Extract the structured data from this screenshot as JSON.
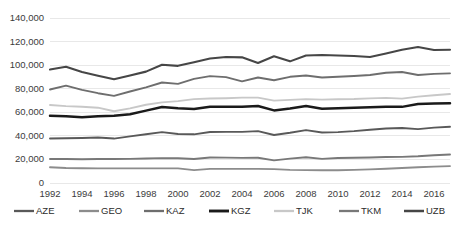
{
  "chart_data": {
    "type": "line",
    "title": "",
    "subtitle": "",
    "xlabel": "",
    "ylabel": "",
    "xlim": [
      1992,
      2017
    ],
    "ylim": [
      0,
      140000
    ],
    "ytick_values": [
      0,
      20000,
      40000,
      60000,
      80000,
      100000,
      120000,
      140000
    ],
    "ytick_labels": [
      "0",
      "20,000",
      "40,000",
      "60,000",
      "80,000",
      "100,000",
      "120,000",
      "140,000"
    ],
    "xtick_values": [
      1992,
      1994,
      1996,
      1998,
      2000,
      2002,
      2004,
      2006,
      2008,
      2010,
      2012,
      2014,
      2016
    ],
    "xtick_labels": [
      "1992",
      "1994",
      "1996",
      "1998",
      "2000",
      "2002",
      "2004",
      "2006",
      "2008",
      "2010",
      "2012",
      "2014",
      "2016"
    ],
    "x": [
      1992,
      1993,
      1994,
      1995,
      1996,
      1997,
      1998,
      1999,
      2000,
      2001,
      2002,
      2003,
      2004,
      2005,
      2006,
      2007,
      2008,
      2009,
      2010,
      2011,
      2012,
      2013,
      2014,
      2015,
      2016,
      2017
    ],
    "grid": "horizontal",
    "legend_position": "bottom",
    "series": [
      {
        "name": "AZE",
        "color": "#595959",
        "width": 1.9,
        "values": [
          37800,
          38000,
          38200,
          38600,
          37700,
          39600,
          41400,
          43200,
          41600,
          41300,
          43300,
          43400,
          43400,
          44000,
          40700,
          42600,
          44900,
          42800,
          43200,
          44000,
          45200,
          46200,
          46700,
          45700,
          47000,
          47700
        ]
      },
      {
        "name": "GEO",
        "color": "#8c8c8c",
        "width": 1.9,
        "values": [
          13400,
          12700,
          12500,
          12400,
          12400,
          12400,
          12400,
          12400,
          12400,
          10900,
          12000,
          12000,
          12000,
          12000,
          11800,
          11100,
          10900,
          10800,
          10800,
          11100,
          11600,
          12100,
          12700,
          13300,
          13900,
          14300
        ]
      },
      {
        "name": "KAZ",
        "color": "#6e6e6e",
        "width": 1.9,
        "values": [
          79300,
          82600,
          79000,
          76200,
          73900,
          77600,
          81100,
          85300,
          84100,
          88300,
          90700,
          89800,
          86200,
          89500,
          87200,
          90100,
          91200,
          89500,
          90100,
          90800,
          91600,
          93500,
          94200,
          91600,
          92600,
          93000
        ]
      },
      {
        "name": "KGZ",
        "color": "#1a1a1a",
        "width": 2.5,
        "values": [
          57100,
          56700,
          55800,
          56600,
          57100,
          58400,
          61400,
          64500,
          63400,
          62800,
          64600,
          64700,
          64700,
          65300,
          61600,
          63200,
          65300,
          63000,
          63400,
          63900,
          64300,
          64600,
          64600,
          67100,
          67400,
          67700
        ]
      },
      {
        "name": "TJK",
        "color": "#c8c8c8",
        "width": 1.9,
        "values": [
          66200,
          65200,
          64700,
          63900,
          60900,
          63300,
          66400,
          68400,
          69500,
          71200,
          71700,
          71900,
          72400,
          72400,
          69900,
          70500,
          71200,
          70700,
          71100,
          71300,
          71800,
          72200,
          71600,
          73300,
          74500,
          75500
        ]
      },
      {
        "name": "TKM",
        "color": "#787878",
        "width": 1.9,
        "values": [
          20400,
          20300,
          20200,
          20300,
          20300,
          20500,
          20800,
          21100,
          21000,
          20400,
          21700,
          21500,
          21300,
          21400,
          19200,
          20700,
          21900,
          20500,
          21200,
          21400,
          21700,
          22000,
          22200,
          22700,
          23500,
          24200
        ]
      },
      {
        "name": "UZB",
        "color": "#464646",
        "width": 2.1,
        "values": [
          96300,
          98600,
          94100,
          91000,
          88000,
          91300,
          94500,
          100300,
          99400,
          102500,
          105600,
          106900,
          106600,
          101800,
          107500,
          103200,
          108200,
          108600,
          108200,
          107800,
          106900,
          109800,
          113000,
          115400,
          112900,
          113000
        ]
      }
    ]
  },
  "legend": {
    "entries": [
      "AZE",
      "GEO",
      "KAZ",
      "KGZ",
      "TJK",
      "TKM",
      "UZB"
    ]
  }
}
